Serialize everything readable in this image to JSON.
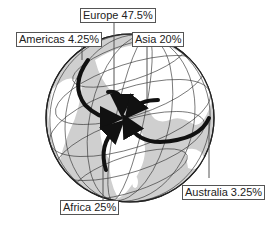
{
  "diagram": {
    "type": "globe-flow-map",
    "labels": [
      {
        "region": "Europe",
        "text": "Europe 47.5%",
        "value": 47.5
      },
      {
        "region": "Americas",
        "text": "Americas 4.25%",
        "value": 4.25
      },
      {
        "region": "Asia",
        "text": "Asia 20%",
        "value": 20
      },
      {
        "region": "Australia",
        "text": "Australia 3.25%",
        "value": 3.25
      },
      {
        "region": "Africa",
        "text": "Africa 25%",
        "value": 25
      }
    ]
  },
  "colors": {
    "land": "#ffffff",
    "ocean": "#cfcfcf",
    "grid": "#333333",
    "arrow": "#111111",
    "label_border": "#555555"
  }
}
